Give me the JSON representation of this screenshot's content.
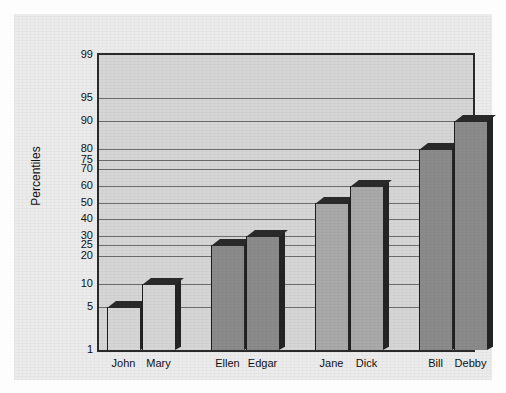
{
  "chart_data": {
    "type": "bar",
    "title": "",
    "xlabel": "",
    "ylabel": "Percentiles",
    "categories": [
      "John",
      "Mary",
      "Ellen",
      "Edgar",
      "Jane",
      "Dick",
      "Bill",
      "Debby"
    ],
    "values": [
      5,
      10,
      25,
      30,
      50,
      60,
      80,
      90
    ],
    "yticks": [
      1,
      5,
      10,
      20,
      25,
      30,
      40,
      50,
      60,
      70,
      75,
      80,
      90,
      95,
      99
    ],
    "ytick_labels": [
      "1",
      "5",
      "10",
      "20",
      "25",
      "30",
      "40",
      "50",
      "60",
      "70",
      "75",
      "80",
      "90",
      "95",
      "99"
    ],
    "ylim": [
      1,
      99
    ],
    "yscale": "probability",
    "grid": true,
    "legend": false,
    "style": "3d-bars",
    "groups": [
      {
        "name": "pair-1",
        "categories": [
          "John",
          "Mary"
        ],
        "values": [
          5,
          10
        ],
        "fill": "#d6d6d6"
      },
      {
        "name": "pair-2",
        "categories": [
          "Ellen",
          "Edgar"
        ],
        "values": [
          25,
          30
        ],
        "fill": "#8b8b8b"
      },
      {
        "name": "pair-3",
        "categories": [
          "Jane",
          "Dick"
        ],
        "values": [
          50,
          60
        ],
        "fill": "#a9a9a9"
      },
      {
        "name": "pair-4",
        "categories": [
          "Bill",
          "Debby"
        ],
        "values": [
          80,
          90
        ],
        "fill": "#8b8b8b"
      }
    ]
  },
  "colors": {
    "page_background": "#fdfdfd",
    "paper": "#ececec",
    "plot_background": "#d6d6d6",
    "axis_line": "#2b2b2b",
    "gridline": "#4a4a4a",
    "bar_top_face": "#2a2a2a",
    "bar_side_face": "#242424",
    "text": "#111111"
  }
}
